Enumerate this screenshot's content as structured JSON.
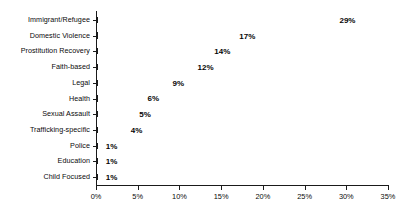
{
  "chart_data": {
    "type": "bar",
    "orientation": "horizontal",
    "title": "",
    "xlabel": "",
    "ylabel": "",
    "xlim": [
      0,
      35
    ],
    "xticks": [
      0,
      5,
      10,
      15,
      20,
      25,
      30,
      35
    ],
    "xtick_labels": [
      "0%",
      "5%",
      "10%",
      "15%",
      "20%",
      "25%",
      "30%",
      "35%"
    ],
    "grid": false,
    "legend": "none",
    "value_suffix": "%",
    "categories": [
      "Immigrant/Refugee",
      "Domestic Violence",
      "Prostitution Recovery",
      "Faith-based",
      "Legal",
      "Health",
      "Sexual Assault",
      "Trafficking-specific",
      "Police",
      "Education",
      "Child Focused"
    ],
    "values": [
      29,
      17,
      14,
      12,
      9,
      6,
      5,
      4,
      1,
      1,
      1
    ],
    "data_labels": [
      "29%",
      "17%",
      "14%",
      "12%",
      "9%",
      "6%",
      "5%",
      "4%",
      "1%",
      "1%",
      "1%"
    ],
    "bar_fill_color": "#ffffff",
    "bar_border_color": "#1a1a1a",
    "axis_color": "#1a1a1a",
    "background_color": "#ffffff"
  }
}
